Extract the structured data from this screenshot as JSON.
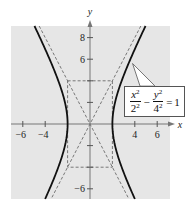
{
  "chart_data": {
    "type": "line",
    "title": "",
    "xlabel": "x",
    "ylabel": "y",
    "xlim": [
      -7,
      7.3
    ],
    "ylim": [
      -6.9,
      9.1
    ],
    "x_ticks": [
      -6,
      -4,
      4,
      6
    ],
    "y_ticks": [
      8,
      6,
      -6
    ],
    "x_tick_labels": [
      "−6",
      "−4",
      "4",
      "6"
    ],
    "y_tick_labels": [
      "8",
      "6",
      "−6"
    ],
    "y_minor_ticks": [
      4,
      2,
      -2,
      -4
    ],
    "grid": false,
    "background": "#e6e6e6",
    "series": [
      {
        "name": "hyperbola",
        "equation": "x^2/2^2 - y^2/4^2 = 1",
        "a": 2,
        "b": 4,
        "style": "solid",
        "color": "#111111"
      },
      {
        "name": "asymptote y = 2x",
        "slope": 2,
        "style": "dashed",
        "color": "#777777"
      },
      {
        "name": "asymptote y = -2x",
        "slope": -2,
        "style": "dashed",
        "color": "#777777"
      },
      {
        "name": "central rectangle",
        "corners": [
          [
            -2,
            4
          ],
          [
            2,
            4
          ],
          [
            2,
            -4
          ],
          [
            -2,
            -4
          ]
        ],
        "style": "dashed",
        "color": "#777777"
      }
    ],
    "annotations": [
      {
        "text": "x²/2² − y²/4² = 1",
        "points_to": [
          3.8,
          5.6
        ],
        "box_position": "right"
      }
    ]
  },
  "equation": {
    "x_var": "x",
    "x_exp": "2",
    "x_den": "2",
    "x_den_exp": "2",
    "minus": "−",
    "y_var": "y",
    "y_exp": "2",
    "y_den": "4",
    "y_den_exp": "2",
    "equals": "=",
    "rhs": "1"
  }
}
